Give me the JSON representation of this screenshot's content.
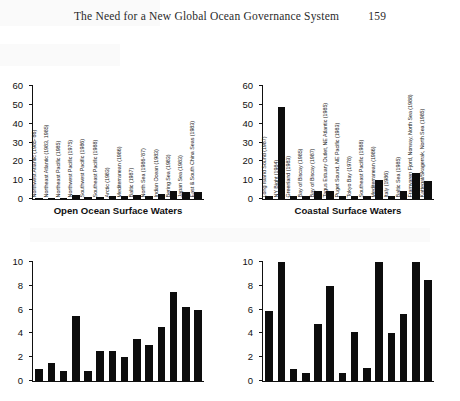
{
  "page": {
    "running_head": "The Need for a New Global Ocean Governance System",
    "page_number": "159"
  },
  "captions": {
    "left": "Open Ocean Surface Waters",
    "right": "Coastal Surface Waters"
  },
  "chart_data": [
    {
      "id": "top-left",
      "type": "bar",
      "title": "Open Ocean Surface Waters",
      "xlabel": "",
      "ylabel": "",
      "ylim": [
        0,
        60
      ],
      "yticks": [
        0,
        10,
        20,
        30,
        40,
        50,
        60
      ],
      "grid": false,
      "legend": "none",
      "categories": [
        "Northwest Atlantic (1985-'86)",
        "Northeast Atlantic (1983, 1985)",
        "Northeast Pacific (1985)",
        "Northwest Pacific (1975)",
        "Southwest Pacific (1986)",
        "Southeast Pacific (1988)",
        "Arctic (1983)",
        "Mediterranean (1986)",
        "Baltic (1987)",
        "North Sea (1986-'87)",
        "Indian Ocean (1983)",
        "Bering Sea (1983)",
        "Japan Sea (1983)",
        "East & South China Seas (1983)"
      ],
      "values": [
        0.6,
        0.6,
        0.6,
        2.3,
        0.9,
        1.3,
        1.6,
        1.8,
        2.0,
        1.7,
        2.6,
        4.4,
        3.6,
        3.6
      ]
    },
    {
      "id": "top-right",
      "type": "bar",
      "title": "Coastal Surface Waters",
      "xlabel": "",
      "ylabel": "",
      "ylim": [
        0,
        60
      ],
      "yticks": [
        0,
        10,
        20,
        30,
        40,
        50,
        60
      ],
      "grid": false,
      "legend": "none",
      "categories": [
        "Long Island Sound (1987)",
        "NY Bight (1984)",
        "Greenland (1983)",
        "Bay of Biscay (1985)",
        "Bay of Biscay (1987)",
        "Tagus Estuary Outlet, NE Atlantic (1985)",
        "Puget Sound, NE Pacific (1983)",
        "Tokyo Bay (1978)",
        "Southeast Pacific (1988)",
        "Mediterranean (1986)",
        "Italy (1986)",
        "Baltic Sea (1985)",
        "Framvaren Fjord, Norway, North Sea (1988)",
        "Kattegat/Skagerrak, North Sea (1985)"
      ],
      "values": [
        1.7,
        49.0,
        1.4,
        1.6,
        4.0,
        4.5,
        1.8,
        1.7,
        1.4,
        10.2,
        1.6,
        4.0,
        14.0,
        9.6
      ]
    },
    {
      "id": "bottom-left",
      "type": "bar",
      "title": "",
      "xlabel": "",
      "ylabel": "",
      "ylim": [
        0,
        10
      ],
      "yticks": [
        0,
        2,
        4,
        6,
        8,
        10
      ],
      "grid": false,
      "legend": "none",
      "categories": [
        "Northwest Atlantic (1985-'86)",
        "Northeast Atlantic (1983, 1985)",
        "Northeast Pacific (1985)",
        "Northwest Pacific (1975)",
        "Southwest Pacific (1986)",
        "Southeast Pacific (1988)",
        "Arctic (1983)",
        "Mediterranean (1986)",
        "Baltic (1987)",
        "North Sea (1986-'87)",
        "Indian Ocean (1983)",
        "Bering Sea (1983)",
        "Japan Sea (1983)",
        "East & South China Seas (1983)"
      ],
      "values": [
        1.0,
        1.5,
        0.8,
        5.5,
        0.8,
        2.5,
        2.5,
        2.0,
        3.5,
        3.0,
        4.5,
        7.5,
        6.2,
        6.0
      ]
    },
    {
      "id": "bottom-right",
      "type": "bar",
      "title": "",
      "xlabel": "",
      "ylabel": "",
      "ylim": [
        0,
        10
      ],
      "yticks": [
        0,
        2,
        4,
        6,
        8,
        10
      ],
      "grid": false,
      "legend": "none",
      "categories": [
        "Long Island Sound (1987)",
        "NY Bight (1984)",
        "Greenland (1983)",
        "Bay of Biscay (1985)",
        "Bay of Biscay (1987)",
        "Tagus Estuary Outlet, NE Atlantic (1985)",
        "Puget Sound, NE Pacific (1983)",
        "Tokyo Bay (1978)",
        "Southeast Pacific (1988)",
        "Mediterranean (1986)",
        "Italy (1986)",
        "Baltic Sea (1985)",
        "Framvaren Fjord, Norway, North Sea (1988)",
        "Kattegat/Skagerrak, North Sea (1985)"
      ],
      "values": [
        5.9,
        10.0,
        1.0,
        0.65,
        4.8,
        8.0,
        0.7,
        4.1,
        1.1,
        10.0,
        4.0,
        5.6,
        10.0,
        8.5
      ]
    }
  ]
}
